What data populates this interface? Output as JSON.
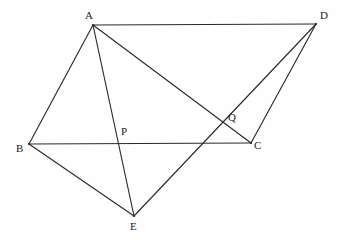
{
  "diagram": {
    "type": "euclidean-geometry-line-figure",
    "canvas": {
      "width": 342,
      "height": 246
    },
    "background_color": "#fefefe",
    "line_color": "#2b2b2b",
    "label_color": "#1c1c1c",
    "points": [
      {
        "id": "A",
        "label": "A",
        "x": 93,
        "y": 25,
        "label_x": 85,
        "label_y": 10,
        "kind": "vertex"
      },
      {
        "id": "D",
        "label": "D",
        "x": 316,
        "y": 24,
        "label_x": 320,
        "label_y": 10,
        "kind": "vertex"
      },
      {
        "id": "B",
        "label": "B",
        "x": 29,
        "y": 144,
        "label_x": 16,
        "label_y": 143,
        "kind": "vertex"
      },
      {
        "id": "C",
        "label": "C",
        "x": 251,
        "y": 143,
        "label_x": 254,
        "label_y": 140,
        "kind": "vertex"
      },
      {
        "id": "E",
        "label": "E",
        "x": 134,
        "y": 216,
        "label_x": 130,
        "label_y": 221,
        "kind": "vertex"
      },
      {
        "id": "P",
        "label": "P",
        "x": 118,
        "y": 141,
        "label_x": 121,
        "label_y": 126,
        "kind": "intersection"
      },
      {
        "id": "Q",
        "label": "Q",
        "x": 230,
        "y": 122,
        "label_x": 228,
        "label_y": 112,
        "kind": "intersection"
      }
    ],
    "edges": [
      {
        "id": "AD",
        "from": "A",
        "to": "D"
      },
      {
        "id": "AB",
        "from": "A",
        "to": "B"
      },
      {
        "id": "AC",
        "from": "A",
        "to": "C"
      },
      {
        "id": "AE",
        "from": "A",
        "to": "E"
      },
      {
        "id": "BC",
        "from": "B",
        "to": "C"
      },
      {
        "id": "BE",
        "from": "B",
        "to": "E"
      },
      {
        "id": "DC",
        "from": "D",
        "to": "C"
      },
      {
        "id": "DE",
        "from": "D",
        "to": "E"
      }
    ],
    "intersections": [
      {
        "id": "P",
        "of": [
          "AE",
          "BC"
        ]
      },
      {
        "id": "Q",
        "of": [
          "AC",
          "DE"
        ]
      }
    ]
  }
}
